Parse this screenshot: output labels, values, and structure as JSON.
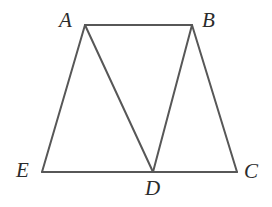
{
  "figure": {
    "background_color": "#ffffff",
    "stroke_color": "#575757",
    "stroke_width": 2,
    "label_color": "#2b2b2b",
    "canvas": {
      "width": 272,
      "height": 207
    },
    "vertices": [
      {
        "id": "A",
        "label": "A",
        "x": 85,
        "y": 25,
        "label_x": 59,
        "label_y": 10
      },
      {
        "id": "B",
        "label": "B",
        "x": 192,
        "y": 25,
        "label_x": 202,
        "label_y": 10
      },
      {
        "id": "C",
        "label": "C",
        "x": 237,
        "y": 172,
        "label_x": 244,
        "label_y": 161
      },
      {
        "id": "D",
        "label": "D",
        "x": 153,
        "y": 172,
        "label_x": 145,
        "label_y": 178
      },
      {
        "id": "E",
        "label": "E",
        "x": 42,
        "y": 172,
        "label_x": 16,
        "label_y": 160
      }
    ],
    "segments": [
      {
        "name": "segment-AB",
        "from": "A",
        "to": "B"
      },
      {
        "name": "segment-AE",
        "from": "A",
        "to": "E"
      },
      {
        "name": "segment-AD",
        "from": "A",
        "to": "D"
      },
      {
        "name": "segment-BD",
        "from": "B",
        "to": "D"
      },
      {
        "name": "segment-BC",
        "from": "B",
        "to": "C"
      },
      {
        "name": "segment-EC",
        "from": "E",
        "to": "C"
      }
    ]
  }
}
